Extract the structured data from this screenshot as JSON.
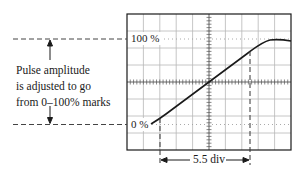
{
  "diagram": {
    "type": "oscilloscope-rise-time",
    "grid": {
      "h_divisions": 10,
      "v_divisions": 8
    },
    "labels": {
      "level_100": "100 %",
      "level_0": "0 %",
      "span": "5.5 div"
    },
    "annotation": {
      "lines": [
        "Pulse amplitude",
        "is adjusted to go",
        "from 0–100% marks"
      ]
    },
    "colors": {
      "line": "#1a1a1a",
      "grid": "#b8b8b8",
      "dotted": "#a0a0a0"
    },
    "measured_span_div": 5.5
  }
}
